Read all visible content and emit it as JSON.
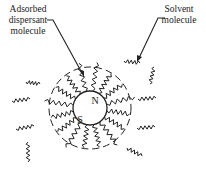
{
  "labels": {
    "adsorbed": [
      "Adsorbed",
      "dispersant",
      "molecule"
    ],
    "solvent": [
      "Solvent",
      "molecule"
    ],
    "pole_north": "N",
    "pole_south": "S"
  },
  "diagram": {
    "adsorbed_chain_count": 16,
    "free_solvent_molecule_count": 9
  }
}
